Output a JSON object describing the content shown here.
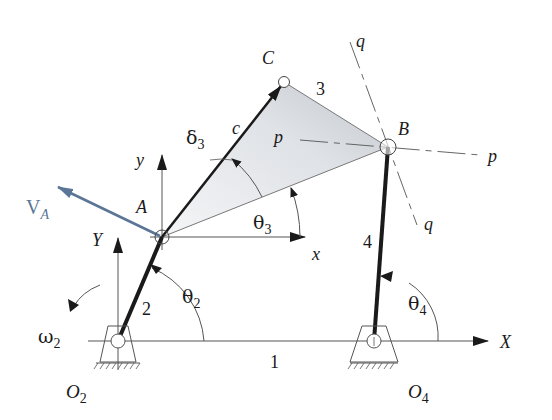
{
  "colors": {
    "ink": "#1a1a1a",
    "thin": "#555555",
    "velocity": "#5a7596",
    "coupler_fill_light": "#f2f3f5",
    "coupler_fill_dark": "#c9cdd3"
  },
  "points": {
    "O2": {
      "x": 118,
      "y": 341,
      "label": "O",
      "sub": "2"
    },
    "O4": {
      "x": 374,
      "y": 341,
      "label": "O",
      "sub": "4"
    },
    "A": {
      "x": 162,
      "y": 237,
      "label": "A"
    },
    "B": {
      "x": 388,
      "y": 147,
      "label": "B"
    },
    "C": {
      "x": 284,
      "y": 82,
      "label": "C"
    }
  },
  "links": {
    "ground": "1",
    "crank": "2",
    "coupler": "3",
    "rocker": "4"
  },
  "labels": {
    "c": "c",
    "x": "x",
    "y": "y",
    "X": "X",
    "Y": "Y",
    "p": "p",
    "q": "q",
    "VA_main": "V",
    "VA_sub": "A",
    "theta": "θ",
    "theta2_sub": "2",
    "theta3_sub": "3",
    "theta4_sub": "4",
    "delta": "δ",
    "delta3_sub": "3",
    "omega": "ω",
    "omega2_sub": "2"
  }
}
